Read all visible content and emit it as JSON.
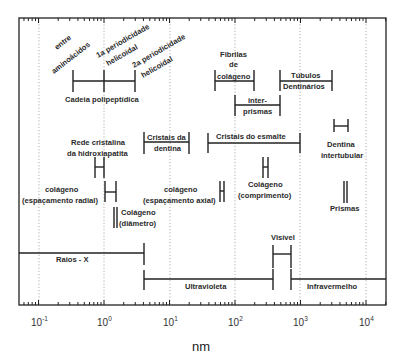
{
  "chart_data": {
    "type": "range-diagram",
    "title": "",
    "xlabel": "nm",
    "xscale": "log",
    "xlim": [
      0.05,
      20000
    ],
    "grid": "vertical dotted at each decade",
    "x_tick_labels": [
      "10^-1",
      "10^0",
      "10^1",
      "10^2",
      "10^3",
      "10^4"
    ],
    "x_ticks": [
      0.1,
      1,
      10,
      100,
      1000,
      10000
    ],
    "ranges": [
      {
        "label": "Cadeia polipeptídica",
        "start": 0.35,
        "end": 3.3,
        "marks": [
          1.0
        ]
      },
      {
        "label": "entre aminoácidos",
        "at": 0.35
      },
      {
        "label": "1a periodicidade helicoidal",
        "at": 1.0
      },
      {
        "label": "2a periodicidade helicoidal",
        "at": 3.3
      },
      {
        "label": "Fibrilas de colágeno",
        "start": 50,
        "end": 200
      },
      {
        "label": "Túbulos Dentinários",
        "start": 1000,
        "end": 3000
      },
      {
        "label": "inter-prismas",
        "start": 100,
        "end": 500
      },
      {
        "label": "Cristais da dentina",
        "start": 4,
        "end": 20
      },
      {
        "label": "Cristais do esmalte",
        "start": 40,
        "end": 1000
      },
      {
        "label": "Rede cristalina da hidroxiapatita",
        "start": 0.8,
        "end": 0.95
      },
      {
        "label": "Dentina intertubular",
        "start": 3500,
        "end": 5000
      },
      {
        "label": "colágeno (espaçamento radial)",
        "start": 1.1,
        "end": 1.5
      },
      {
        "label": "colágeno (espaçamento axial)",
        "start": 64,
        "end": 68
      },
      {
        "label": "Colágeno (comprimento)",
        "start": 280,
        "end": 300
      },
      {
        "label": "Colágeno (diâmetro)",
        "start": 1.4,
        "end": 1.5
      },
      {
        "label": "Prismas",
        "start": 5000,
        "end": 6000
      },
      {
        "label": "Visível",
        "start": 400,
        "end": 750
      },
      {
        "label": "Raios - X",
        "start": 0.05,
        "end": 4
      },
      {
        "label": "Ultravioleta",
        "start": 4,
        "end": 400
      },
      {
        "label": "Infravermelho",
        "start": 750,
        "end": 20000
      }
    ]
  },
  "axis": {
    "xlabel": "nm",
    "ticks": [
      "10",
      "10",
      "10",
      "10",
      "10",
      "10"
    ],
    "exponents": [
      "-1",
      "0",
      "1",
      "2",
      "3",
      "4"
    ]
  },
  "labels": {
    "entre": "entre",
    "aminoacidos": "aminoácidos",
    "per1_a": "1a periodicidade",
    "per1_b": "helicoidal",
    "per2_a": "2a periodicidade",
    "per2_b": "helicoidal",
    "cadeia": "Cadeia polipeptídica",
    "fibrilas_a": "Fibrilas",
    "fibrilas_b": "de",
    "fibrilas_c": "colágeno",
    "tubulos_a": "Túbulos",
    "tubulos_b": "Dentinários",
    "inter_a": "inter-",
    "inter_b": "prismas",
    "rede_a": "Rede cristalina",
    "rede_b": "da hidroxiapatita",
    "cristais_dentina_a": "Cristais da",
    "cristais_dentina_b": "dentina",
    "cristais_esmalte": "Cristais do esmalte",
    "dentina_inter_a": "Dentina",
    "dentina_inter_b": "intertubular",
    "col_radial_a": "colágeno",
    "col_radial_b": "(espaçamento radial)",
    "col_axial_a": "colágeno",
    "col_axial_b": "(espaçamento axial)",
    "col_comp_a": "Colágeno",
    "col_comp_b": "(comprimento)",
    "col_diam_a": "Colágeno",
    "col_diam_b": "(diâmetro)",
    "prismas": "Prismas",
    "visivel": "Visível",
    "raios_x": "Raios - X",
    "ultravioleta": "Ultravioleta",
    "infravermelho": "Infravermelho"
  }
}
